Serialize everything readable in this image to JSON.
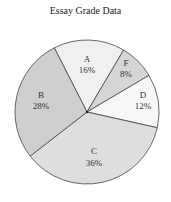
{
  "chart_data": {
    "type": "pie",
    "title": "Essay Grade Data",
    "categories": [
      "A",
      "F",
      "D",
      "C",
      "B"
    ],
    "values": [
      16,
      8,
      12,
      36,
      28
    ],
    "unit": "%",
    "colors": [
      "#f0f0f0",
      "#d6d6d6",
      "#f7f7f7",
      "#dedede",
      "#cfcfcf"
    ],
    "start_angle_deg": -117,
    "legend": "none (labels inside slices)"
  },
  "labels": {
    "A": {
      "name": "A",
      "pct": "16%"
    },
    "F": {
      "name": "F",
      "pct": "8%"
    },
    "D": {
      "name": "D",
      "pct": "12%"
    },
    "C": {
      "name": "C",
      "pct": "36%"
    },
    "B": {
      "name": "B",
      "pct": "28%"
    }
  }
}
